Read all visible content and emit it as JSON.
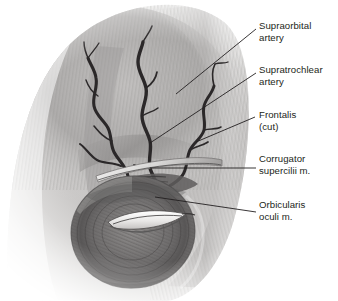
{
  "figure": {
    "width": 338,
    "height": 301,
    "background_color": "#ffffff",
    "ink_color": "#231f20"
  },
  "labels": [
    {
      "name": "supraorbital-artery",
      "line1": "Supraorbital",
      "line2": "artery",
      "x": 259,
      "y": 20,
      "leader": {
        "x1": 256,
        "y1": 29,
        "x2": 176,
        "y2": 94
      }
    },
    {
      "name": "supratrochlear-artery",
      "line1": "Supratrochlear",
      "line2": "artery",
      "x": 259,
      "y": 64,
      "leader": {
        "x1": 256,
        "y1": 73,
        "x2": 150,
        "y2": 143
      }
    },
    {
      "name": "frontalis-cut",
      "line1": "Frontalis",
      "line2": "(cut)",
      "x": 259,
      "y": 109,
      "leader": {
        "x1": 255,
        "y1": 117,
        "x2": 196,
        "y2": 142
      }
    },
    {
      "name": "corrugator-supercilii",
      "line1": "Corrugator",
      "line2": "supercilii m.",
      "x": 259,
      "y": 153,
      "leader": {
        "x1": 256,
        "y1": 168,
        "x2": 150,
        "y2": 168
      }
    },
    {
      "name": "orbicularis-oculi",
      "line1": "Orbicularis",
      "line2": "oculi m.",
      "x": 259,
      "y": 199,
      "leader": {
        "x1": 256,
        "y1": 212,
        "x2": 155,
        "y2": 197
      }
    }
  ],
  "anatomy": {
    "structures": [
      {
        "name": "frontalis-muscle",
        "description": "broad striated muscle sheet of the forehead, reflected with cut edge"
      },
      {
        "name": "supraorbital-artery",
        "description": "tortuous branching vessel ascending on the forehead"
      },
      {
        "name": "supratrochlear-artery",
        "description": "medial tortuous branching vessel ascending on the forehead"
      },
      {
        "name": "corrugator-supercilii-muscle",
        "description": "small oblique muscle deep to frontalis at the brow"
      },
      {
        "name": "orbicularis-oculi-muscle",
        "description": "elliptical sphincter muscle ring encircling the palpebral fissure"
      },
      {
        "name": "palpebral-fissure",
        "description": "lens-shaped eye opening between the lids"
      }
    ],
    "palette": {
      "muscle_light": "#d8d6d4",
      "muscle_mid": "#a9a7a6",
      "muscle_dark": "#6f6d6d",
      "vessel": "#2b2829",
      "shadow": "#4a4849"
    }
  }
}
